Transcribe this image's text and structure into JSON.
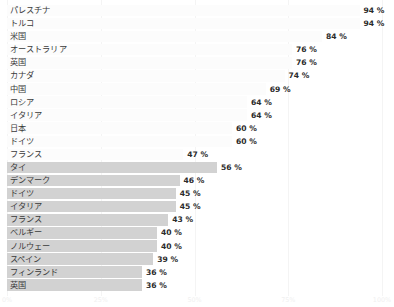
{
  "chart_data": {
    "type": "bar",
    "orientation": "horizontal",
    "title": "",
    "xlabel": "",
    "ylabel": "",
    "xlim": [
      0,
      100
    ],
    "grid": true,
    "legend": null,
    "value_suffix": "%",
    "axis_ticks": [
      "0%",
      "25%",
      "50%",
      "75%",
      "100%"
    ],
    "axis_tick_values": [
      0,
      25,
      50,
      75,
      100
    ],
    "groups": [
      {
        "name": "group-top",
        "bar_color": "#fcfcfc",
        "categories": [
          "パレスチナ",
          "トルコ",
          "米国",
          "オーストラリア",
          "英国",
          "カナダ",
          "中国",
          "ロシア",
          "イタリア",
          "日本",
          "ドイツ",
          "フランス"
        ],
        "values": [
          94,
          94,
          84,
          76,
          76,
          74,
          69,
          64,
          64,
          60,
          60,
          47
        ],
        "labels": [
          "94 %",
          "94 %",
          "84 %",
          "76 %",
          "76 %",
          "74 %",
          "69 %",
          "64 %",
          "64 %",
          "60 %",
          "60 %",
          "47 %"
        ]
      },
      {
        "name": "group-bottom",
        "bar_color": "#d2d2d2",
        "categories": [
          "タイ",
          "デンマーク",
          "ドイツ",
          "イタリア",
          "フランス",
          "ベルギー",
          "ノルウェー",
          "スペイン",
          "フィンランド",
          "英国"
        ],
        "values": [
          56,
          46,
          45,
          45,
          43,
          40,
          40,
          39,
          36,
          36
        ],
        "labels": [
          "56 %",
          "46 %",
          "45 %",
          "45 %",
          "43 %",
          "40 %",
          "40 %",
          "39 %",
          "36 %",
          "36 %"
        ]
      }
    ]
  }
}
